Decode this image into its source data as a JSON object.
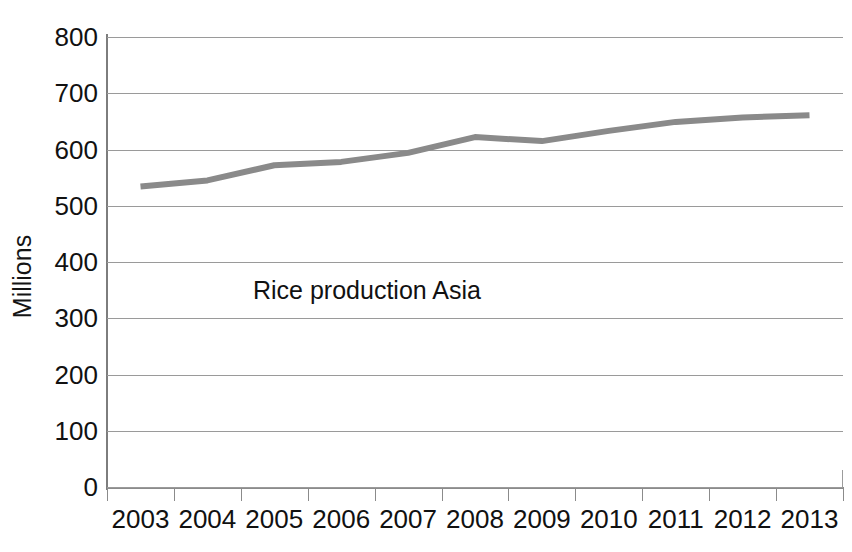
{
  "chart_data": {
    "type": "line",
    "title": "",
    "annotation": "Rice production Asia",
    "xlabel": "",
    "ylabel": "Millions",
    "categories": [
      "2003",
      "2004",
      "2005",
      "2006",
      "2007",
      "2008",
      "2009",
      "2010",
      "2011",
      "2012",
      "2013"
    ],
    "values": [
      534,
      545,
      572,
      578,
      594,
      622,
      615,
      633,
      649,
      657,
      661
    ],
    "series": [
      {
        "name": "Rice production Asia",
        "values": [
          534,
          545,
          572,
          578,
          594,
          622,
          615,
          633,
          649,
          657,
          661
        ]
      }
    ],
    "ylim": [
      0,
      800
    ],
    "ytick_labels": [
      "800",
      "700",
      "600",
      "500",
      "400",
      "300",
      "200",
      "100",
      "0"
    ],
    "ytick_values": [
      800,
      700,
      600,
      500,
      400,
      300,
      200,
      100,
      0
    ],
    "grid": true,
    "legend": false,
    "legend_position": "none",
    "line_color": "#8a8a8a",
    "gridline_color": "#9a9a9a",
    "axis_color": "#8b8b8b",
    "text_color": "#111111",
    "background_color": "#ffffff"
  }
}
